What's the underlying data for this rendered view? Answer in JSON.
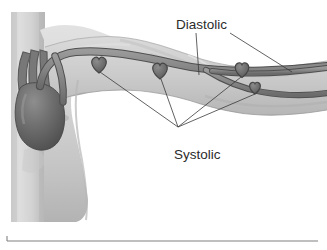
{
  "figure": {
    "kind": "anatomical-illustration",
    "width": 327,
    "height": 250,
    "background_color": "#ffffff"
  },
  "annotations": [
    {
      "id": "diastolic",
      "label": "Diastolic",
      "x": 176,
      "y": 29,
      "text_color": "#2b2b2b",
      "leader_targets": [
        {
          "from_x": 196,
          "from_y": 33,
          "to_x": 199,
          "to_y": 75
        },
        {
          "from_x": 230,
          "from_y": 33,
          "to_x": 292,
          "to_y": 72
        }
      ]
    },
    {
      "id": "systolic",
      "label": "Systolic",
      "x": 174,
      "y": 159,
      "text_color": "#2b2b2b",
      "hub_x": 178,
      "hub_y": 128,
      "leader_targets": [
        {
          "to_x": 100,
          "to_y": 72
        },
        {
          "to_x": 160,
          "to_y": 78
        },
        {
          "to_x": 241,
          "to_y": 76
        },
        {
          "to_x": 254,
          "to_y": 93
        }
      ]
    }
  ],
  "anatomy": {
    "torso": {
      "name": "torso",
      "fill_light": "#d6d6d6",
      "fill_mid": "#c2c2c2",
      "fill_shadow": "#adadad"
    },
    "arm": {
      "name": "arm",
      "fill_light": "#dcdcdc",
      "fill_mid": "#c8c8c8",
      "fill_shadow": "#b0b0b0",
      "outline": "#8d8d8d"
    },
    "heart_organ": {
      "name": "heart-organ",
      "fill": "#6e6e6e",
      "fill_dark": "#575757",
      "highlight": "#8a8a8a",
      "outline": "#4a4a4a"
    },
    "artery": {
      "name": "artery",
      "fill": "#8a8a8a",
      "outline": "#4f4f4f",
      "width_upper_arm": 6.5,
      "width_forearm": 4.6
    }
  },
  "pulse_markers": [
    {
      "id": "marker-upper-arm",
      "label": "pulse-point-upper-arm",
      "x": 99,
      "y": 65,
      "size": 15
    },
    {
      "id": "marker-elbow",
      "label": "pulse-point-elbow",
      "x": 160,
      "y": 71,
      "size": 15
    },
    {
      "id": "marker-radial",
      "label": "pulse-point-radial",
      "x": 242,
      "y": 70,
      "size": 14
    },
    {
      "id": "marker-ulnar",
      "label": "pulse-point-ulnar",
      "x": 255,
      "y": 88,
      "size": 11
    }
  ],
  "frame": {
    "bottom_rule": {
      "x1": 7,
      "y1": 241,
      "x2": 318,
      "y2": 241
    },
    "left_tick": {
      "x1": 7,
      "y1": 236,
      "x2": 7,
      "y2": 241
    },
    "color": "#808080"
  }
}
